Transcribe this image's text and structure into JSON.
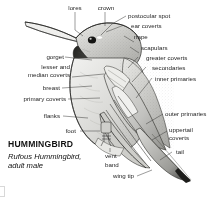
{
  "figure": {
    "kind": "bird-anatomy-diagram",
    "title": "HUMMINGBIRD",
    "subtitle_species": "Rufous Hummingbird,",
    "subtitle_age_sex": "adult male",
    "ink_color": "#1f1f1f",
    "background_color": "#ffffff"
  },
  "labels": {
    "lores": "lores",
    "crown": "crown",
    "postocular_spot": "postocular spot",
    "ear_coverts": "ear coverts",
    "nape": "nape",
    "scapulars": "scapulars",
    "greater_coverts": "greater coverts",
    "secondaries": "secondaries",
    "inner_primaries": "inner primaries",
    "outer_primaries": "outer primaries",
    "uppertail_coverts": "uppertail\ncoverts",
    "uppertail_coverts_line1": "uppertail",
    "uppertail_coverts_line2": "coverts",
    "tail": "tail",
    "wing_tip": "wing tip",
    "vent_band_line1": "vent",
    "vent_band_line2": "band",
    "foot": "foot",
    "flanks": "flanks",
    "primary_coverts": "primary coverts",
    "breast": "breast",
    "lesser_median_line1": "lesser and",
    "lesser_median_line2": "median coverts",
    "gorget": "gorget"
  }
}
